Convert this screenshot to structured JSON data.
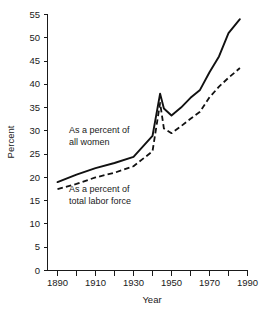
{
  "chart_data": {
    "type": "line",
    "title": "",
    "xlabel": "Year",
    "ylabel": "Percent",
    "xlim": [
      1885,
      1995
    ],
    "ylim": [
      0,
      55
    ],
    "grid": false,
    "legend_position": "inline-annotation",
    "x_ticks_major": [
      1890,
      1910,
      1930,
      1950,
      1970,
      1990
    ],
    "x_ticks_minor": [
      1900,
      1920,
      1940,
      1960,
      1980
    ],
    "x_tick_labels": [
      "1890",
      "1910",
      "1930",
      "1950",
      "1970",
      "1990"
    ],
    "y_ticks": [
      0,
      5,
      10,
      15,
      20,
      25,
      30,
      35,
      40,
      45,
      50,
      55
    ],
    "y_tick_labels": [
      "0",
      "5",
      "10",
      "15",
      "20",
      "25",
      "30",
      "35",
      "40",
      "45",
      "50",
      "55"
    ],
    "series": [
      {
        "name": "As a percent of all women",
        "style": "solid",
        "label_line_1": "As a percent of",
        "label_line_2": "all women",
        "x": [
          1890,
          1900,
          1910,
          1920,
          1930,
          1940,
          1944,
          1946,
          1950,
          1955,
          1960,
          1965,
          1970,
          1975,
          1980,
          1986
        ],
        "values": [
          19.0,
          20.6,
          22.0,
          23.1,
          24.4,
          28.9,
          38.0,
          34.8,
          33.3,
          35.0,
          37.1,
          38.8,
          42.6,
          46.0,
          51.0,
          54.0
        ]
      },
      {
        "name": "As a percent of total labor force",
        "style": "dashed",
        "label_line_1": "As a percent of",
        "label_line_2": "total labor force",
        "x": [
          1890,
          1900,
          1910,
          1920,
          1930,
          1940,
          1944,
          1946,
          1950,
          1955,
          1960,
          1965,
          1970,
          1975,
          1980,
          1986
        ],
        "values": [
          17.5,
          18.6,
          20.0,
          21.0,
          22.4,
          25.6,
          36.0,
          30.5,
          29.5,
          31.0,
          32.6,
          34.1,
          37.2,
          39.5,
          41.4,
          43.5
        ]
      }
    ],
    "annotations": [
      {
        "name": "annotation-all-women",
        "line_1": "As a percent of",
        "line_2": "all women",
        "anchor_x": 1912,
        "anchor_y": 28.5
      },
      {
        "name": "annotation-total-labor-force",
        "line_1": "As a percent of",
        "line_2": "total labor force",
        "anchor_x": 1912,
        "anchor_y": 16.5
      }
    ]
  },
  "axes": {
    "y_title": "Percent",
    "x_title": "Year"
  }
}
